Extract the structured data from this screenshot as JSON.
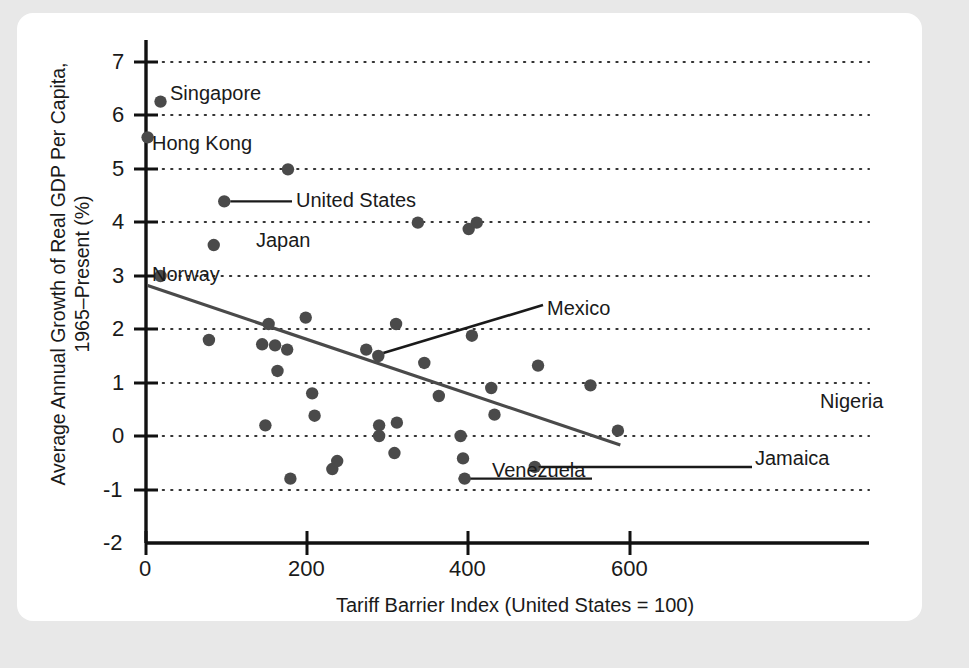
{
  "chart_data": {
    "type": "scatter",
    "title": "",
    "xlabel": "Tariff Barrier Index (United States = 100)",
    "ylabel": "Average Annual Growth of Real GDP Per Capita, 1965–Present (%)",
    "ylabel_line1": "Average Annual Growth of Real GDP Per Capita,",
    "ylabel_line2": "1965–Present (%)",
    "xlim": [
      0,
      660
    ],
    "ylim": [
      -2,
      7.4
    ],
    "xticks": [
      0,
      200,
      400,
      600
    ],
    "xtick_labels": [
      "0",
      "200",
      "400",
      "600"
    ],
    "yticks": [
      -2,
      -1,
      0,
      1,
      2,
      3,
      4,
      5,
      6,
      7
    ],
    "ytick_labels": [
      "-2",
      "-1",
      "0",
      "1",
      "2",
      "3",
      "4",
      "5",
      "6",
      "7"
    ],
    "grid": "horizontal-dotted",
    "legend": "none",
    "marker_color": "#4a4a4a",
    "trendline_color": "#4a4a4a",
    "axis_color": "#111111",
    "grid_color": "#333333",
    "trendline": {
      "x_start": 2,
      "y_start": 2.82,
      "x_end": 588,
      "y_end": -0.17
    },
    "points": [
      {
        "x": 18,
        "y": 6.27,
        "label": "Singapore"
      },
      {
        "x": 2,
        "y": 5.6,
        "label": "Hong Kong"
      },
      {
        "x": 176,
        "y": 5.0,
        "label": ""
      },
      {
        "x": 97,
        "y": 4.4,
        "label": "United States"
      },
      {
        "x": 84,
        "y": 3.58,
        "label": "Japan"
      },
      {
        "x": 18,
        "y": 3.0,
        "label": "Norway"
      },
      {
        "x": 337,
        "y": 4.0,
        "label": ""
      },
      {
        "x": 400,
        "y": 3.88,
        "label": ""
      },
      {
        "x": 410,
        "y": 4.0,
        "label": ""
      },
      {
        "x": 78,
        "y": 1.8,
        "label": ""
      },
      {
        "x": 152,
        "y": 2.1,
        "label": ""
      },
      {
        "x": 144,
        "y": 1.72,
        "label": ""
      },
      {
        "x": 160,
        "y": 1.7,
        "label": ""
      },
      {
        "x": 175,
        "y": 1.62,
        "label": ""
      },
      {
        "x": 198,
        "y": 2.22,
        "label": ""
      },
      {
        "x": 163,
        "y": 1.22,
        "label": ""
      },
      {
        "x": 206,
        "y": 0.8,
        "label": ""
      },
      {
        "x": 209,
        "y": 0.38,
        "label": ""
      },
      {
        "x": 148,
        "y": 0.2,
        "label": ""
      },
      {
        "x": 179,
        "y": -0.8,
        "label": ""
      },
      {
        "x": 231,
        "y": -0.62,
        "label": ""
      },
      {
        "x": 237,
        "y": -0.47,
        "label": ""
      },
      {
        "x": 273,
        "y": 1.62,
        "label": ""
      },
      {
        "x": 288,
        "y": 1.5,
        "label": "Mexico"
      },
      {
        "x": 310,
        "y": 2.1,
        "label": ""
      },
      {
        "x": 289,
        "y": 0.2,
        "label": ""
      },
      {
        "x": 289,
        "y": 0.0,
        "label": ""
      },
      {
        "x": 311,
        "y": 0.25,
        "label": ""
      },
      {
        "x": 308,
        "y": -0.32,
        "label": ""
      },
      {
        "x": 345,
        "y": 1.37,
        "label": ""
      },
      {
        "x": 363,
        "y": 0.75,
        "label": ""
      },
      {
        "x": 390,
        "y": 0.0,
        "label": ""
      },
      {
        "x": 393,
        "y": -0.42,
        "label": ""
      },
      {
        "x": 395,
        "y": -0.8,
        "label": "Venezuela"
      },
      {
        "x": 404,
        "y": 1.88,
        "label": ""
      },
      {
        "x": 428,
        "y": 0.9,
        "label": ""
      },
      {
        "x": 432,
        "y": 0.4,
        "label": ""
      },
      {
        "x": 482,
        "y": -0.58,
        "label": "Jamaica"
      },
      {
        "x": 486,
        "y": 1.32,
        "label": ""
      },
      {
        "x": 551,
        "y": 0.95,
        "label": ""
      },
      {
        "x": 585,
        "y": 0.1,
        "label": "Nigeria"
      }
    ],
    "annotations": [
      {
        "name": "Singapore",
        "text": "Singapore",
        "style": "right-of-point"
      },
      {
        "name": "Hong Kong",
        "text": "Hong Kong",
        "style": "right-of-point"
      },
      {
        "name": "United States",
        "text": "United States",
        "style": "leader-right"
      },
      {
        "name": "Japan",
        "text": "Japan",
        "style": "right-of-point"
      },
      {
        "name": "Norway",
        "text": "Norway",
        "style": "left-of-point"
      },
      {
        "name": "Mexico",
        "text": "Mexico",
        "style": "leader-up-right"
      },
      {
        "name": "Venezuela",
        "text": "Venezuela",
        "style": "leader-left"
      },
      {
        "name": "Jamaica",
        "text": "Jamaica",
        "style": "leader-right"
      },
      {
        "name": "Nigeria",
        "text": "Nigeria",
        "style": "above-point"
      }
    ]
  }
}
